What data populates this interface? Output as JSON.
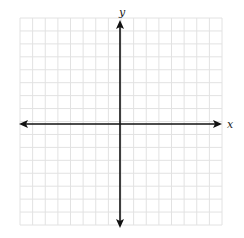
{
  "diagram": {
    "type": "coordinate-plane",
    "x_axis_label": "x",
    "y_axis_label": "y",
    "grid": {
      "left": 20,
      "top": 18,
      "right": 222,
      "bottom": 225,
      "cols": 16,
      "rows": 16,
      "color": "#e2e2e2"
    },
    "origin": {
      "x": 120,
      "y": 124
    },
    "axis_color": "#111111",
    "arrows": [
      "left",
      "right",
      "up",
      "down"
    ]
  }
}
